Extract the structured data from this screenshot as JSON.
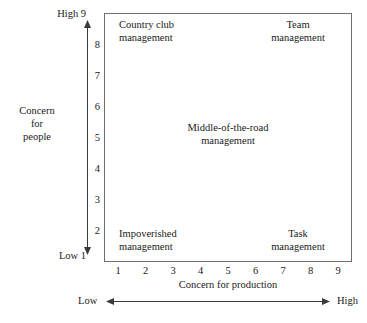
{
  "chart_data": {
    "type": "diagram",
    "xlabel": "Concern for production",
    "ylabel": "Concern for people",
    "xlim": [
      1,
      9
    ],
    "ylim": [
      1,
      9
    ],
    "grid": false,
    "legend": "none",
    "x_ticks": [
      "1",
      "2",
      "3",
      "4",
      "5",
      "6",
      "7",
      "8",
      "9"
    ],
    "y_ticks": [
      "9",
      "8",
      "7",
      "6",
      "5",
      "4",
      "3",
      "2",
      "1"
    ],
    "x_range_low_label": "Low",
    "x_range_high_label": "High",
    "y_range_low_label": "Low",
    "y_range_high_label": "High",
    "y_low_tick": "1",
    "y_high_tick": "9",
    "annotations": [
      {
        "id": "country-club",
        "text": "Country club management",
        "line1": "Country club",
        "line2": "management",
        "x": 1,
        "y": 9,
        "position": "top-left"
      },
      {
        "id": "team",
        "text": "Team management",
        "line1": "Team",
        "line2": "management",
        "x": 9,
        "y": 9,
        "position": "top-right"
      },
      {
        "id": "middle-of-the-road",
        "text": "Middle-of-the-road management",
        "line1": "Middle-of-the-road",
        "line2": "management",
        "x": 5,
        "y": 5,
        "position": "center"
      },
      {
        "id": "impoverished",
        "text": "Impoverished management",
        "line1": "Impoverished",
        "line2": "management",
        "x": 1,
        "y": 1,
        "position": "bottom-left"
      },
      {
        "id": "task",
        "text": "Task management",
        "line1": "Task",
        "line2": "management",
        "x": 9,
        "y": 1,
        "position": "bottom-right"
      }
    ]
  },
  "axes": {
    "y": {
      "title_line1": "Concern",
      "title_line2": "for",
      "title_line3": "people",
      "high_word": "High",
      "high_value": "9",
      "low_word": "Low",
      "low_value": "1",
      "ticks": [
        "9",
        "8",
        "7",
        "6",
        "5",
        "4",
        "3",
        "2",
        "1"
      ]
    },
    "x": {
      "title": "Concern for production",
      "low_word": "Low",
      "high_word": "High",
      "ticks": [
        "1",
        "2",
        "3",
        "4",
        "5",
        "6",
        "7",
        "8",
        "9"
      ]
    }
  },
  "quadrants": {
    "top_left": {
      "line1": "Country club",
      "line2": "management"
    },
    "top_right": {
      "line1": "Team",
      "line2": "management"
    },
    "center": {
      "line1": "Middle-of-the-road",
      "line2": "management"
    },
    "bottom_left": {
      "line1": "Impoverished",
      "line2": "management"
    },
    "bottom_right": {
      "line1": "Task",
      "line2": "management"
    }
  },
  "colors": {
    "ink": "#1a1a1a",
    "box_border": "#6f6f6f",
    "background": "#ffffff"
  }
}
